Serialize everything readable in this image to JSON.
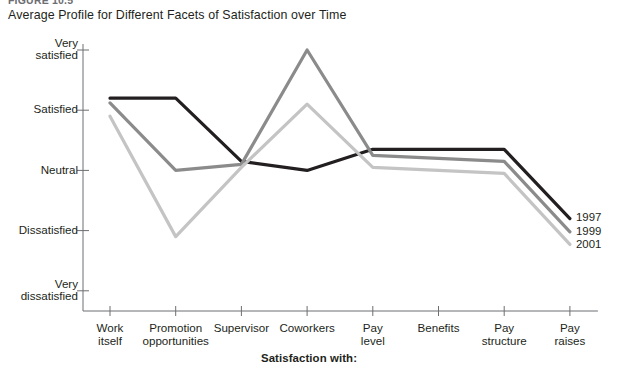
{
  "figure": {
    "label": "FIGURE 10.5",
    "title": "Average Profile for Different Facets of Satisfaction over Time"
  },
  "chart_data": {
    "type": "line",
    "title": "Average Profile for Different Facets of Satisfaction over Time",
    "xlabel": "Satisfaction with:",
    "ylabel": "",
    "categories": [
      "Work itself",
      "Promotion opportunities",
      "Supervisor",
      "Coworkers",
      "Pay level",
      "Benefits",
      "Pay structure",
      "Pay raises"
    ],
    "category_lines": [
      [
        "Work",
        "itself"
      ],
      [
        "Promotion",
        "opportunities"
      ],
      [
        "Supervisor",
        ""
      ],
      [
        "Coworkers",
        ""
      ],
      [
        "Pay",
        "level"
      ],
      [
        "Benefits",
        ""
      ],
      [
        "Pay",
        "structure"
      ],
      [
        "Pay",
        "raises"
      ]
    ],
    "ytick_labels": [
      [
        "Very",
        "satisfied"
      ],
      [
        "Satisfied",
        ""
      ],
      [
        "Neutral",
        ""
      ],
      [
        "Dissatisfied",
        ""
      ],
      [
        "Very",
        "dissatisfied"
      ]
    ],
    "ytick_values": [
      5,
      4,
      3,
      2,
      1
    ],
    "ylim": [
      1,
      5
    ],
    "grid": false,
    "legend_position": "right-end-of-lines",
    "series": [
      {
        "name": "1997",
        "color": "#231f20",
        "values": [
          4.2,
          4.2,
          3.15,
          3.0,
          3.35,
          3.35,
          3.35,
          2.2
        ]
      },
      {
        "name": "1999",
        "color": "#8b8b8b",
        "values": [
          4.12,
          3.0,
          3.1,
          5.0,
          3.25,
          3.2,
          3.15,
          1.98
        ]
      },
      {
        "name": "2001",
        "color": "#c4c4c4",
        "values": [
          3.9,
          1.9,
          3.05,
          4.1,
          3.05,
          3.0,
          2.95,
          1.77
        ]
      }
    ]
  }
}
